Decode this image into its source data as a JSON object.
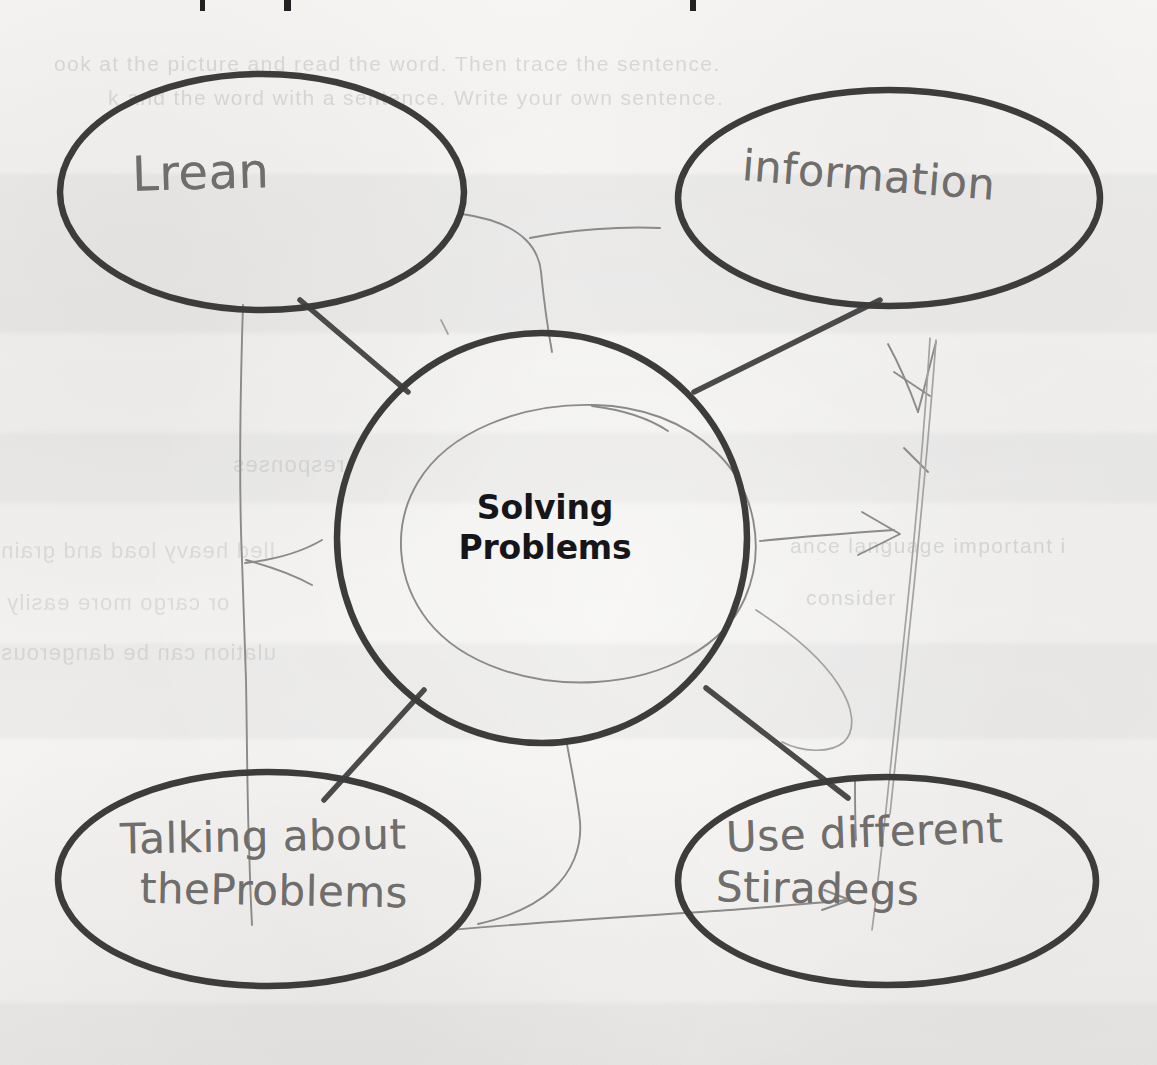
{
  "document": {
    "type": "handwritten-worksheet-scan",
    "subject": "graphic-organizer-web-diagram"
  },
  "diagram": {
    "type": "bubble-web",
    "center": {
      "label_line_1": "Solving",
      "label_line_2": "Problems",
      "printed": true
    },
    "nodes": [
      {
        "id": "top-left",
        "position": "top-left",
        "text": "Lrean",
        "handwritten": true
      },
      {
        "id": "top-right",
        "position": "top-right",
        "text": "information",
        "handwritten": true
      },
      {
        "id": "bottom-left",
        "position": "bottom-left",
        "text_line_1": "Talking about",
        "text_line_2": "theProblems",
        "handwritten": true
      },
      {
        "id": "bottom-right",
        "position": "bottom-right",
        "text_line_1": "Use different",
        "text_line_2": "Stiradegs",
        "handwritten": true
      }
    ],
    "connectors": [
      {
        "from": "center",
        "to": "top-left"
      },
      {
        "from": "center",
        "to": "top-right"
      },
      {
        "from": "center",
        "to": "bottom-left"
      },
      {
        "from": "center",
        "to": "bottom-right"
      }
    ]
  },
  "ghost_text": {
    "top_line_1": "ook at the picture and read the word. Then trace the sentence.",
    "top_line_2": "k and the word with a sentence. Write your own sentence.",
    "middle_line_1": "lled heavy load and grain",
    "middle_line_2": "or cargo more easily",
    "middle_line_3": "ulation can be dangerous",
    "right_line_1": "ance language important i",
    "right_line_2": "consider",
    "left_line_1": "responses"
  },
  "colors": {
    "paper": "#f3f2f0",
    "printed_ink": "#3c3c3c",
    "pencil": "#8b8a88",
    "center_text": "#16161a",
    "handwriting": "#6f6e6c",
    "ghost": "#5f5f64"
  }
}
